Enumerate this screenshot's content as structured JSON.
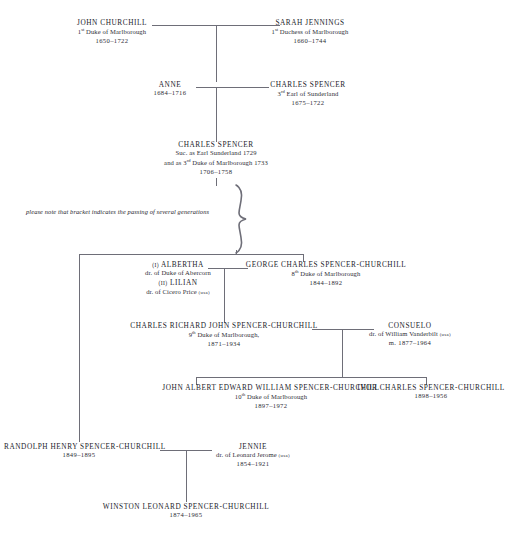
{
  "diagram": {
    "note": "please note that bracket indicates the passing of several generations",
    "line_color": "#6e6e78"
  },
  "people": {
    "john_churchill": {
      "name": "John Churchill",
      "title": "1st Duke of Marlborough",
      "title_ordinal": "1",
      "title_suffix": "st",
      "title_rest": " Duke of Marlborough",
      "years": "1650–1722"
    },
    "sarah_jennings": {
      "name": "Sarah Jennings",
      "title": "1st Duchess of Marlborough",
      "title_ordinal": "1",
      "title_suffix": "st",
      "title_rest": " Duchess of Marlborough",
      "years": "1660–1744"
    },
    "anne": {
      "name": "Anne",
      "years": "1684–1716"
    },
    "charles_spencer_3rd_earl": {
      "name": "Charles Spencer",
      "title_ordinal": "3",
      "title_suffix": "rd",
      "title_rest": " Earl of Sunderland",
      "years": "1675–1722"
    },
    "charles_spencer_3rd_duke": {
      "name": "Charles Spencer",
      "line1": "Suc. as Earl Sunderland 1729",
      "line2_pre": "and as 3",
      "line2_suffix": "rd",
      "line2_post": " Duke of Marlborough 1733",
      "years": "1706–1758"
    },
    "albertha_lilian": {
      "wife1_marker": "(i)",
      "wife1_name": "Albertha",
      "wife1_desc": "dr. of Duke of Abercorn",
      "wife2_marker": "(ii)",
      "wife2_name": "Lilian",
      "wife2_desc_pre": "dr. of Cicero Price ",
      "wife2_desc_usa": "(usa)"
    },
    "george_charles": {
      "name": "George Charles Spencer-Churchill",
      "title_ordinal": "8",
      "title_suffix": "th",
      "title_rest": " Duke of Marlborough",
      "years": "1844–1892"
    },
    "charles_richard_john": {
      "name": "Charles Richard John Spencer-Churchill",
      "title_ordinal": "9",
      "title_suffix": "th",
      "title_rest": " Duke of Marlborough,",
      "years": "1871–1934"
    },
    "consuelo": {
      "name": "Consuelo",
      "desc_pre": "dr. of William Vanderbilt ",
      "desc_usa": "(usa)",
      "years": "m. 1877–1964"
    },
    "john_albert_edward_william": {
      "name": "John Albert Edward William Spencer-Churchill",
      "title_ordinal": "10",
      "title_suffix": "th",
      "title_rest": " Duke of Marlborough",
      "years": "1897–1972"
    },
    "ivor_charles": {
      "name": "Ivor Charles Spencer-Churchill",
      "years": "1898–1956"
    },
    "randolph_henry": {
      "name": "Randolph Henry Spencer-Churchill",
      "years": "1849–1895"
    },
    "jennie": {
      "name": "Jennie",
      "desc_pre": "dr. of Leonard Jerome ",
      "desc_usa": "(usa)",
      "years": "1854–1921"
    },
    "winston": {
      "name": "Winston Leonard Spencer-Churchill",
      "years": "1874–1965"
    }
  }
}
